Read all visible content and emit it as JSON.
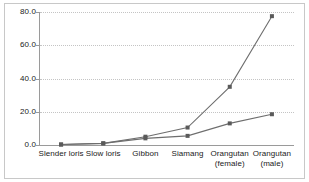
{
  "chart_data": {
    "type": "line",
    "title": "",
    "subtitle": "",
    "xlabel": "",
    "ylabel": "",
    "categories": [
      "Slender loris",
      "Slow loris",
      "Gibbon",
      "Siamang",
      "Orangutan\n(female)",
      "Orangutan\n(male)"
    ],
    "series": [
      {
        "name": "series-1",
        "marker": "square",
        "color": "#6e6e6e",
        "values": [
          0.3,
          1.0,
          5.0,
          10.5,
          35.0,
          77.5
        ]
      },
      {
        "name": "series-2",
        "marker": "square",
        "color": "#6e6e6e",
        "values": [
          0.3,
          1.0,
          4.0,
          5.5,
          13.0,
          18.5
        ]
      }
    ],
    "ylim": [
      0,
      80
    ],
    "yticks": [
      0,
      20,
      40,
      60,
      80
    ],
    "ytick_labels": [
      "0.0",
      "20.0",
      "40.0",
      "60.0",
      "80.0"
    ],
    "grid": true,
    "grid_axis": "y",
    "legend": "none",
    "legend_position": "none",
    "colors": {
      "line": "#6e6e6e",
      "marker": "#5a5a5a",
      "grid": "#c4c4c4",
      "axis": "#9a9a9a",
      "text": "#1a1a1a",
      "background": "#ffffff",
      "frame": "#c8c8c8"
    }
  }
}
